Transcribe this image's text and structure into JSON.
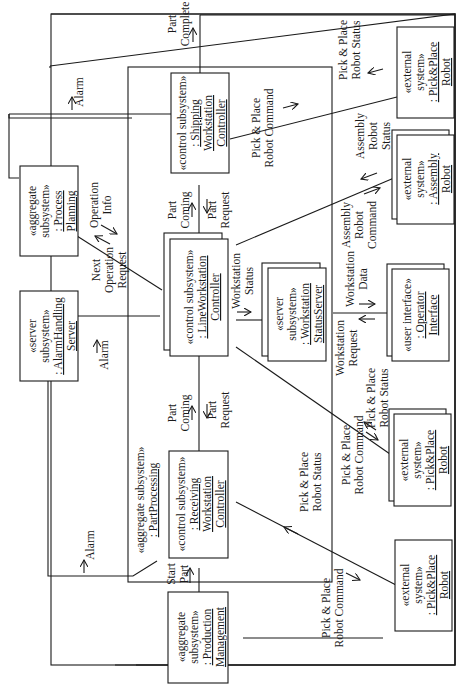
{
  "diagram": {
    "type": "UML communication diagram",
    "orientation": "rotated 90 degrees counter-clockwise",
    "colors": {
      "line": "#1a1a1a",
      "background": "#ffffff"
    },
    "frames": {
      "outer": {
        "stereotype": "",
        "name": ""
      },
      "part_processing": {
        "stereotype": "«aggregate subsystem»",
        "name": ": PartProcessing"
      }
    },
    "nodes": {
      "process_planning": {
        "line1": "«aggregate",
        "line2": "subsystem»",
        "line3": ": Process",
        "line4": "Planning"
      },
      "alarm_handling": {
        "line1": "«server",
        "line2": "subsystem»",
        "line3": ": AlarmHandling",
        "line4": "Server"
      },
      "production_mgmt": {
        "line1": "«aggregate",
        "line2": "subsystem»",
        "line3": ": Production",
        "line4": "Management"
      },
      "receiving_ctrl": {
        "line1": "«control subsystem»",
        "line2": ": Receiving",
        "line3": "Workstation",
        "line4": "Controller"
      },
      "line_ctrl": {
        "line1": "«control subsystem»",
        "line2": ": LineWorkstation",
        "line3": "Controller"
      },
      "shipping_ctrl": {
        "line1": "«control subsystem»",
        "line2": ": Shipping",
        "line3": "Workstation",
        "line4": "Controller"
      },
      "status_server": {
        "line1": "«server",
        "line2": "subsystem»",
        "line3": ": Workstation",
        "line4": "StatusServer"
      },
      "operator_iface": {
        "line1": "«user interface»",
        "line2": ": Operator",
        "line3": "Interface"
      },
      "robot_top": {
        "line1": "«external",
        "line2": "system»",
        "line3": ": Pick&Place",
        "line4": "Robot"
      },
      "assembly_robot": {
        "line1": "«external",
        "line2": "system»",
        "line3": ": Assembly",
        "line4": "Robot"
      },
      "robot_mid": {
        "line1": "«external",
        "line2": "system»",
        "line3": ": Pick&Place",
        "line4": "Robot"
      },
      "robot_bottom": {
        "line1": "«external",
        "line2": "system»",
        "line3": ": Pick&Place",
        "line4": "Robot"
      }
    },
    "messages": {
      "alarm_top": "Alarm",
      "alarm_mid": "Alarm",
      "alarm_bottom": "Alarm",
      "operation_info": {
        "l1": "Operation",
        "l2": "Info"
      },
      "next_op_req": {
        "l1": "Next",
        "l2": "Operation",
        "l3": "Request"
      },
      "start_part": {
        "l1": "Start",
        "l2": "Part"
      },
      "part_coming_1": {
        "l1": "Part",
        "l2": "Coming"
      },
      "part_request_1": {
        "l1": "Part",
        "l2": "Request"
      },
      "part_coming_2": {
        "l1": "Part",
        "l2": "Coming"
      },
      "part_request_2": {
        "l1": "Part",
        "l2": "Request"
      },
      "part_complete": {
        "l1": "Part",
        "l2": "Complete"
      },
      "ws_status": {
        "l1": "Workstation",
        "l2": "Status"
      },
      "ws_data": {
        "l1": "Workstation",
        "l2": "Data"
      },
      "ws_request": {
        "l1": "Workstation",
        "l2": "Request"
      },
      "ppr_cmd_ship": {
        "l1": "Pick & Place",
        "l2": "Robot Command"
      },
      "ppr_status_ship": {
        "l1": "Pick & Place",
        "l2": "Robot Status"
      },
      "asm_cmd": {
        "l1": "Assembly",
        "l2": "Robot",
        "l3": "Command"
      },
      "asm_status": {
        "l1": "Assembly",
        "l2": "Robot",
        "l3": "Status"
      },
      "ppr_cmd_line": {
        "l1": "Pick & Place",
        "l2": "Robot Command"
      },
      "ppr_status_line": {
        "l1": "Pick & Place",
        "l2": "Robot Status"
      },
      "ppr_cmd_recv": {
        "l1": "Pick & Place",
        "l2": "Robot Command"
      },
      "ppr_status_recv": {
        "l1": "Pick & Place",
        "l2": "Robot Status"
      }
    }
  }
}
